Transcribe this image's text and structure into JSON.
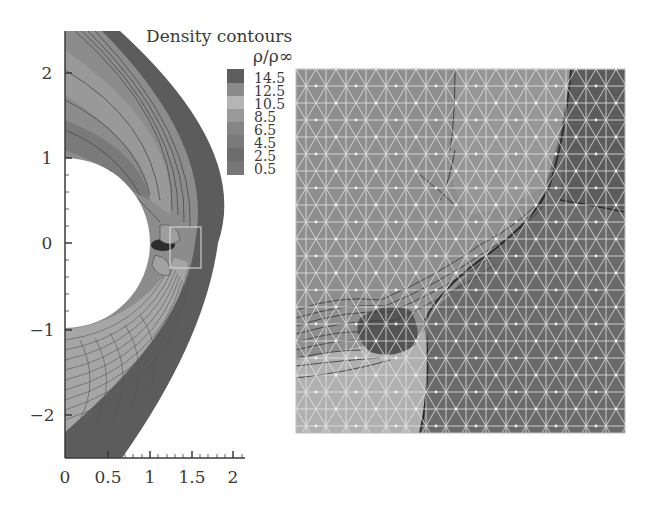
{
  "legend": {
    "title": "Density contours",
    "subtitle": "ρ/ρ∞",
    "levels": [
      "14.5",
      "12.5",
      "10.5",
      "8.5",
      "6.5",
      "4.5",
      "2.5",
      "0.5"
    ],
    "colors": [
      "#5e5e5e",
      "#8a8a8a",
      "#b5b5b5",
      "#9a9a9a",
      "#858585",
      "#7a7a7a",
      "#6c6c6c",
      "#777777"
    ]
  },
  "left_plot": {
    "x_ticks": [
      "0",
      "0.5",
      "1",
      "1.5",
      "2"
    ],
    "y_ticks": [
      "2",
      "1",
      "0",
      "−1",
      "−2"
    ],
    "xlim": [
      0,
      2.2
    ],
    "ylim": [
      -2.5,
      2.5
    ],
    "body": "cylinder of radius 1 centered at origin",
    "inset_box": {
      "x": [
        1.25,
        1.6
      ],
      "y": [
        -0.3,
        0.2
      ]
    }
  },
  "right_plot": {
    "description": "Zoomed view of inset box showing triangular mesh overlaid on density contours near shock triple point"
  },
  "colors": {
    "shock_layer_dark": "#5a5a5a",
    "shock_layer_mid": "#858585",
    "shock_layer_light": "#a8a8a8",
    "mesh_lines": "#e6e6e6",
    "contour_lines": "#3c3c3c",
    "axis": "#3a3a3a"
  }
}
